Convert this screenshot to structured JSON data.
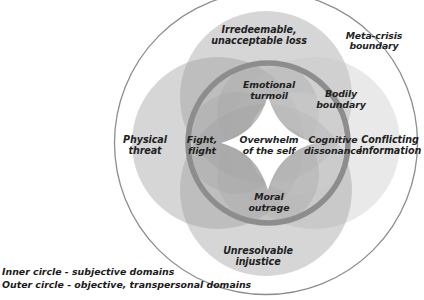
{
  "figure": {
    "outer_boundary_label": "Meta-crisis\nboundary",
    "center_label": "Overwhelm\nof the self",
    "caption_lines": [
      "Inner circle - subjective domains",
      "Outer circle - objective, transpersonal domains"
    ]
  },
  "outer_domains": [
    {
      "id": "irredeemable-loss",
      "label": "Irredeemable,\nunacceptable loss",
      "position": "top"
    },
    {
      "id": "physical-threat",
      "label": "Physical\nthreat",
      "position": "left"
    },
    {
      "id": "conflicting-information",
      "label": "Conflicting\ninformation",
      "position": "right"
    },
    {
      "id": "unresolvable-injustice",
      "label": "Unresolvable\ninjustice",
      "position": "bottom"
    }
  ],
  "inner_domains": [
    {
      "id": "emotional-turmoil",
      "label": "Emotional\nturmoil",
      "position": "top"
    },
    {
      "id": "bodily-boundary",
      "label": "Bodily\nboundary",
      "position": "top-right"
    },
    {
      "id": "fight-flight",
      "label": "Fight,\nflight",
      "position": "left"
    },
    {
      "id": "cognitive-dissonance",
      "label": "Cognitive\ndissonance",
      "position": "right"
    },
    {
      "id": "moral-outrage",
      "label": "Moral\noutrage",
      "position": "bottom"
    }
  ],
  "geometry": {
    "outer_circle": {
      "cx": 266,
      "cy": 143,
      "r": 152
    },
    "inner_ring": {
      "cx": 268,
      "cy": 143,
      "r": 80,
      "stroke_width": 6
    },
    "outer_petals": {
      "r": 85,
      "offset": 48
    },
    "inner_petals": {
      "r": 50,
      "offset": 31
    }
  },
  "colors": {
    "background": "#ffffff",
    "outer_circle_stroke": "#8c8c8c",
    "inner_ring_stroke": "#8e8e8e",
    "petal_fill": "#a9a9a9",
    "petal_fill_light": "#bdbdbd",
    "text": "#221f1f"
  }
}
